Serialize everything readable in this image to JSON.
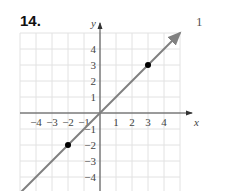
{
  "problem": {
    "number": "14.",
    "side_label": "1"
  },
  "chart_data": {
    "type": "line",
    "title": "",
    "xlabel": "x",
    "ylabel": "y",
    "xlim": [
      -5,
      5
    ],
    "ylim": [
      -5,
      5
    ],
    "grid": true,
    "x_tick_labels": [
      "−4",
      "−3",
      "−2",
      "−1",
      "1",
      "2",
      "3",
      "4"
    ],
    "y_tick_labels": [
      "4",
      "3",
      "2",
      "1",
      "−1",
      "−2",
      "−3",
      "−4"
    ],
    "series": [
      {
        "name": "y = x",
        "kind": "line",
        "slope": 1,
        "intercept": 0,
        "x": [
          -5,
          5
        ],
        "y": [
          -5,
          5
        ],
        "arrows": "both",
        "color": "#808080"
      },
      {
        "name": "points",
        "kind": "scatter",
        "x": [
          -2,
          3
        ],
        "y": [
          -2,
          3
        ],
        "color": "#000000"
      }
    ],
    "legend": "none"
  }
}
